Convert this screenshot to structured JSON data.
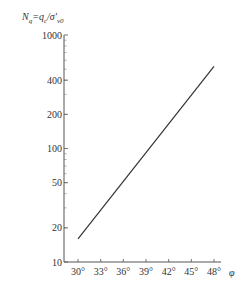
{
  "chart_data": {
    "type": "line",
    "title": "",
    "ylabel": "N_q = q_c / σ'_v0",
    "xlabel": "φ",
    "yscale": "log",
    "ylim": [
      10,
      1000
    ],
    "xlim": [
      28,
      50
    ],
    "y_ticks": [
      {
        "value": 10,
        "label": "10"
      },
      {
        "value": 20,
        "label": "20"
      },
      {
        "value": 50,
        "label": "50"
      },
      {
        "value": 100,
        "label": "100"
      },
      {
        "value": 200,
        "label": "200"
      },
      {
        "value": 400,
        "label": "400"
      },
      {
        "value": 1000,
        "label": "1000"
      }
    ],
    "x_ticks": [
      {
        "value": 30,
        "label": "30°"
      },
      {
        "value": 33,
        "label": "33°"
      },
      {
        "value": 36,
        "label": "36°"
      },
      {
        "value": 39,
        "label": "39°"
      },
      {
        "value": 42,
        "label": "42°"
      },
      {
        "value": 45,
        "label": "45°"
      },
      {
        "value": 48,
        "label": "48°"
      }
    ],
    "series": [
      {
        "name": "N_q vs φ",
        "x": [
          30,
          48
        ],
        "values": [
          16,
          530
        ]
      }
    ],
    "grid": false
  },
  "labels": {
    "ylabel_N": "N",
    "ylabel_q_sub": "q",
    "ylabel_eq": "=q",
    "ylabel_c_sub": "c",
    "ylabel_slash": "/σ'",
    "ylabel_v0_sub": "v0",
    "xlabel": "φ"
  }
}
